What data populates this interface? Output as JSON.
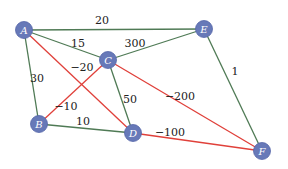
{
  "colors": {
    "node_fill": "#6779b8",
    "node_stroke": "#5566a8",
    "positive_edge": "#4f7a55",
    "negative_edge": "#e0403a",
    "background": "#ffffff"
  },
  "nodes": [
    {
      "id": "A",
      "label": "A",
      "x": 24,
      "y": 30
    },
    {
      "id": "B",
      "label": "B",
      "x": 39,
      "y": 124
    },
    {
      "id": "C",
      "label": "C",
      "x": 108,
      "y": 60
    },
    {
      "id": "D",
      "label": "D",
      "x": 133,
      "y": 133
    },
    {
      "id": "E",
      "label": "E",
      "x": 204,
      "y": 29
    },
    {
      "id": "F",
      "label": "F",
      "x": 262,
      "y": 151
    }
  ],
  "edges": [
    {
      "from": "A",
      "to": "E",
      "weight": "20",
      "sign": "positive",
      "lx": 102,
      "ly": 24
    },
    {
      "from": "A",
      "to": "C",
      "weight": "15",
      "sign": "positive",
      "lx": 78,
      "ly": 47
    },
    {
      "from": "A",
      "to": "B",
      "weight": "30",
      "sign": "positive",
      "lx": 37,
      "ly": 82
    },
    {
      "from": "A",
      "to": "D",
      "weight": "−20",
      "sign": "negative",
      "lx": 82,
      "ly": 71
    },
    {
      "from": "C",
      "to": "E",
      "weight": "300",
      "sign": "positive",
      "lx": 135,
      "ly": 47
    },
    {
      "from": "B",
      "to": "C",
      "weight": "−10",
      "sign": "negative",
      "lx": 66,
      "ly": 110
    },
    {
      "from": "C",
      "to": "D",
      "weight": "50",
      "sign": "positive",
      "lx": 130,
      "ly": 103
    },
    {
      "from": "C",
      "to": "F",
      "weight": "−200",
      "sign": "negative",
      "lx": 180,
      "ly": 100
    },
    {
      "from": "B",
      "to": "D",
      "weight": "10",
      "sign": "positive",
      "lx": 83,
      "ly": 125
    },
    {
      "from": "D",
      "to": "F",
      "weight": "−100",
      "sign": "negative",
      "lx": 170,
      "ly": 136
    },
    {
      "from": "E",
      "to": "F",
      "weight": "1",
      "sign": "positive",
      "lx": 235,
      "ly": 75
    }
  ]
}
